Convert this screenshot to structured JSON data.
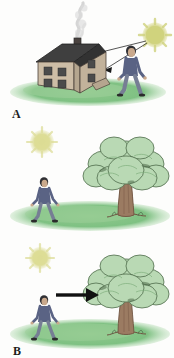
{
  "figure": {
    "background_color": "#fdfdfc",
    "width": 174,
    "height": 358
  },
  "palette": {
    "ground_green": "#7fc183",
    "ground_green_light": "#a7d5a5",
    "sun_yellow": "#d3d585",
    "sun_yellow_pale": "#e2e2a8",
    "house_wall": "#cdbda6",
    "house_wall_shadow": "#b5a68f",
    "roof_dark": "#3a3a3a",
    "smoke_gray": "#d8d8d8",
    "tree_canopy": "#b9d9b4",
    "tree_canopy_shadow": "#9cc89a",
    "tree_outline": "#4e6b4a",
    "trunk_brown": "#9b7b62",
    "trunk_brown_dark": "#6f5341",
    "person_shirt": "#5a6384",
    "person_pants": "#767e94",
    "person_skin": "#caa98c",
    "person_hair": "#2f2f33",
    "arrow_black": "#111111",
    "ray_line": "#2b2b2b",
    "label_color": "#1d1d1d"
  },
  "panels": [
    {
      "id": "a",
      "label": "A",
      "caption_order": 1,
      "elements": [
        "sun",
        "sun-rays",
        "house",
        "chimney",
        "smoke",
        "person",
        "ground"
      ],
      "description": "Sun at upper right emits rays that strike a two-story house and a standing person; smoke rises from the chimney."
    },
    {
      "id": "b",
      "label": "B",
      "caption_order": 2,
      "elements": [
        "sun",
        "tree",
        "person",
        "ground"
      ],
      "description": "Sun at upper left, a person standing on grass at left, and a large leafy tree at right."
    },
    {
      "id": "c",
      "label": "C",
      "caption_order": 3,
      "elements": [
        "sun",
        "tree",
        "person",
        "arrow",
        "ground"
      ],
      "description": "Same scene as B with a thick black arrow pointing from the person toward the tree."
    }
  ]
}
